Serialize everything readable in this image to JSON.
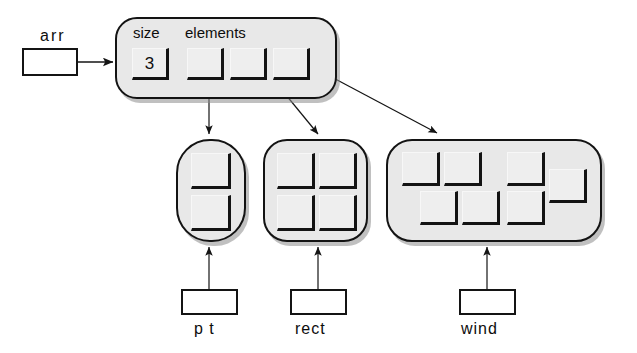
{
  "diagram": {
    "type": "pointer-structure-diagram",
    "colors": {
      "object_fill": "#e8e8e8",
      "cell_fill": "#eeeeee",
      "stroke": "#131313",
      "page_background": "#ffffff",
      "shadow": "#8c8c8c"
    }
  },
  "variables": {
    "arr": {
      "label": "arr",
      "value": ""
    },
    "pt": {
      "label": "p t",
      "value": ""
    },
    "rect": {
      "label": "rect",
      "value": ""
    },
    "wind": {
      "label": "wind",
      "value": ""
    }
  },
  "array_object": {
    "fields": [
      {
        "name": "size",
        "label": "size",
        "value": "3"
      },
      {
        "name": "elements",
        "label": "elements",
        "value": ""
      }
    ],
    "size_value": "3",
    "elements_label": "elements",
    "element_slots": [
      {
        "index": 0,
        "value": "",
        "points_to": "pt"
      },
      {
        "index": 1,
        "value": "",
        "points_to": "rect"
      },
      {
        "index": 2,
        "value": "",
        "points_to": "wind"
      }
    ]
  },
  "objects": [
    {
      "name": "pt",
      "variable": "p t",
      "cell_count": 2,
      "layout": "1x2"
    },
    {
      "name": "rect",
      "variable": "rect",
      "cell_count": 4,
      "layout": "2x2"
    },
    {
      "name": "wind",
      "variable": "wind",
      "cell_count": 7,
      "layout": "staggered"
    }
  ],
  "arrows": [
    {
      "name": "arr-to-array",
      "from": "arr-box",
      "to": "array-object"
    },
    {
      "name": "element0-to-pt",
      "from": "element-slot-0",
      "to": "object-pt"
    },
    {
      "name": "element1-to-rect",
      "from": "element-slot-1",
      "to": "object-rect"
    },
    {
      "name": "element2-to-wind",
      "from": "element-slot-2",
      "to": "object-wind"
    },
    {
      "name": "pt-var-to-object",
      "from": "pt-box",
      "to": "object-pt"
    },
    {
      "name": "rect-var-to-object",
      "from": "rect-box",
      "to": "object-rect"
    },
    {
      "name": "wind-var-to-object",
      "from": "wind-box",
      "to": "object-wind"
    }
  ]
}
